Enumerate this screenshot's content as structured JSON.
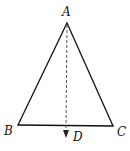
{
  "diagram": {
    "type": "geometry",
    "colors": {
      "stroke": "#111111",
      "background": "#ffffff"
    },
    "vertices": {
      "A": {
        "label": "A",
        "x": 67,
        "y": 23
      },
      "B": {
        "label": "B",
        "x": 18,
        "y": 125
      },
      "C": {
        "label": "C",
        "x": 113,
        "y": 126
      },
      "D": {
        "label": "D",
        "x": 66,
        "y": 137
      }
    },
    "segments": [
      {
        "from": "A",
        "to": "B",
        "style": "solid"
      },
      {
        "from": "A",
        "to": "C",
        "style": "solid"
      },
      {
        "from": "B",
        "to": "C",
        "style": "solid"
      },
      {
        "from": "A",
        "to": "D",
        "style": "dashed",
        "arrow": true
      }
    ],
    "labels": {
      "A": "A",
      "B": "B",
      "C": "C",
      "D": "D"
    }
  }
}
